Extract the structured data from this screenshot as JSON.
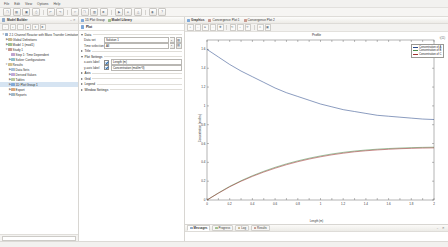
{
  "menu": {
    "items": [
      "File",
      "Edit",
      "View",
      "Options",
      "Help"
    ]
  },
  "toolbar": {
    "buttons": [
      {
        "name": "new-file-button",
        "glyph": "❐"
      },
      {
        "name": "open-file-button",
        "glyph": "▤"
      },
      {
        "name": "save-button",
        "glyph": "▣"
      },
      {
        "name": "print-button",
        "glyph": "⎙"
      },
      {
        "name": "undo-button",
        "glyph": "↶"
      },
      {
        "name": "redo-button",
        "glyph": "↷"
      },
      {
        "name": "cut-button",
        "glyph": "✂"
      },
      {
        "name": "copy-button",
        "glyph": "❐"
      },
      {
        "name": "paste-button",
        "glyph": "▧"
      },
      {
        "name": "delete-button",
        "glyph": "✖"
      },
      {
        "name": "build-button",
        "glyph": "▶"
      },
      {
        "name": "compute-button",
        "glyph": "="
      },
      {
        "name": "mesh-button",
        "glyph": "△"
      },
      {
        "name": "plot-button",
        "glyph": "◉"
      },
      {
        "name": "help-button",
        "glyph": "?"
      }
    ]
  },
  "model_builder": {
    "header": "Model Builder",
    "tools": [
      {
        "name": "collapse-all-icon",
        "glyph": "−"
      },
      {
        "name": "expand-all-icon",
        "glyph": "+"
      },
      {
        "name": "show-hide-icon",
        "glyph": "□"
      },
      {
        "name": "move-up-icon",
        "glyph": "▲"
      },
      {
        "name": "move-down-icon",
        "glyph": "▼"
      },
      {
        "name": "delete-node-icon",
        "glyph": "✖"
      }
    ],
    "tree": [
      {
        "label": "2.1 Channel Reactor with Mass Transfer Limitations",
        "depth": 0,
        "twisty": "▼",
        "color": "#8fa9c8",
        "selected": false
      },
      {
        "label": "Global Definitions",
        "depth": 1,
        "twisty": "▶",
        "color": "#c8b88f",
        "selected": false
      },
      {
        "label": "Model 1 (mod1)",
        "depth": 1,
        "twisty": "▶",
        "color": "#9fbf8f",
        "selected": false
      },
      {
        "label": "Study 1",
        "depth": 1,
        "twisty": "▼",
        "color": "#c89a8f",
        "selected": false
      },
      {
        "label": "Step 1: Time Dependent",
        "depth": 2,
        "twisty": "",
        "color": "#bfa3cf",
        "selected": false
      },
      {
        "label": "Solver Configurations",
        "depth": 2,
        "twisty": "▶",
        "color": "#8fbfc8",
        "selected": false
      },
      {
        "label": "Results",
        "depth": 1,
        "twisty": "▼",
        "color": "#d0c08f",
        "selected": false
      },
      {
        "label": "Data Sets",
        "depth": 2,
        "twisty": "▶",
        "color": "#a8c0d8",
        "selected": false
      },
      {
        "label": "Derived Values",
        "depth": 2,
        "twisty": "▶",
        "color": "#c0a8d8",
        "selected": false
      },
      {
        "label": "Tables",
        "depth": 2,
        "twisty": "▶",
        "color": "#b8c8a0",
        "selected": false
      },
      {
        "label": "1D Plot Group 1",
        "depth": 2,
        "twisty": "▶",
        "color": "#7ea8d8",
        "selected": true
      },
      {
        "label": "Export",
        "depth": 2,
        "twisty": "▶",
        "color": "#d8a87e",
        "selected": false
      },
      {
        "label": "Reports",
        "depth": 2,
        "twisty": "▶",
        "color": "#a0b8c8",
        "selected": false
      }
    ]
  },
  "settings": {
    "tabs": [
      {
        "label": "1D Plot Group",
        "active": false,
        "icon_color": "#7ea8d8"
      },
      {
        "label": "Model Library",
        "active": true,
        "icon_color": "#9fbf8f"
      }
    ],
    "title": "Plot",
    "sections": [
      {
        "name": "data",
        "label": "Data",
        "open": true,
        "fields": [
          {
            "name": "data-set",
            "label": "Data set",
            "value": "Solution 1",
            "type": "combo"
          },
          {
            "name": "time-selection",
            "label": "Time selection",
            "value": "All",
            "type": "combo"
          }
        ]
      },
      {
        "name": "title",
        "label": "Title",
        "open": false,
        "fields": []
      },
      {
        "name": "plot-settings",
        "label": "Plot Settings",
        "open": true,
        "fields": [
          {
            "name": "x-axis-label",
            "label": "x-axis label",
            "value": "Length (m)",
            "type": "check-text",
            "checked": true
          },
          {
            "name": "y-axis-label",
            "label": "y-axis label",
            "value": "Concentration (mol/m^3)",
            "type": "check-text",
            "checked": true
          }
        ]
      },
      {
        "name": "axis",
        "label": "Axis",
        "open": false,
        "fields": []
      },
      {
        "name": "grid",
        "label": "Grid",
        "open": false,
        "fields": []
      },
      {
        "name": "legend",
        "label": "Legend",
        "open": false,
        "fields": []
      },
      {
        "name": "window-settings",
        "label": "Window Settings",
        "open": false,
        "fields": []
      }
    ]
  },
  "graphics": {
    "tabs": [
      {
        "label": "Graphics",
        "active": true,
        "icon_color": "#7ea8d8"
      },
      {
        "label": "Convergence Plot 1",
        "active": false,
        "icon_color": "#c89a8f"
      },
      {
        "label": "Convergence Plot 2",
        "active": false,
        "icon_color": "#c89a8f"
      }
    ],
    "tools": [
      {
        "name": "zoom-in-icon",
        "glyph": "+"
      },
      {
        "name": "zoom-out-icon",
        "glyph": "−"
      },
      {
        "name": "zoom-extents-icon",
        "glyph": "⧉"
      },
      {
        "name": "zoom-box-icon",
        "glyph": "□"
      },
      {
        "name": "pan-icon",
        "glyph": "✚"
      },
      {
        "name": "rotate-icon",
        "glyph": "↻"
      },
      {
        "name": "transparency-icon",
        "glyph": "◐"
      },
      {
        "name": "scene-light-icon",
        "glyph": "☀"
      },
      {
        "name": "print-graphics-icon",
        "glyph": "⎙"
      },
      {
        "name": "image-snapshot-icon",
        "glyph": "▣"
      }
    ],
    "corner_label": "t(11)"
  },
  "chart_data": {
    "type": "line",
    "title": "Profile",
    "xlabel": "Length (m)",
    "ylabel": "Concentration (mol/m³)",
    "xlim": [
      0,
      2.0
    ],
    "ylim": [
      0,
      1.7
    ],
    "xticks": [
      "0",
      "0.1",
      "0.2",
      "0.4",
      "0.6",
      "1",
      "1.2",
      "1.4",
      "1.6",
      "1.8",
      "2",
      "2.2",
      "2.4"
    ],
    "yticks": [
      "0",
      "0.2",
      "0.4",
      "0.6",
      "0.8",
      "1",
      "1.2",
      "1.4",
      "1.6"
    ],
    "grid": false,
    "legend_position": "top-right",
    "series": [
      {
        "name": "Concentration of A",
        "color": "#2a4a8a",
        "x": [
          0,
          0.1,
          0.2,
          0.3,
          0.4,
          0.5,
          0.6,
          0.7,
          0.8,
          0.9,
          1.0,
          1.1,
          1.2,
          1.3,
          1.4,
          1.5,
          1.6,
          1.7,
          1.8,
          1.9,
          2.0
        ],
        "y": [
          1.6,
          1.52,
          1.44,
          1.37,
          1.31,
          1.25,
          1.19,
          1.14,
          1.1,
          1.06,
          1.02,
          0.99,
          0.96,
          0.94,
          0.92,
          0.9,
          0.89,
          0.88,
          0.87,
          0.86,
          0.855
        ]
      },
      {
        "name": "Concentration of B",
        "color": "#4a8a4a",
        "x": [
          0,
          0.1,
          0.2,
          0.3,
          0.4,
          0.5,
          0.6,
          0.7,
          0.8,
          0.9,
          1.0,
          1.1,
          1.2,
          1.3,
          1.4,
          1.5,
          1.6,
          1.7,
          1.8,
          1.9,
          2.0
        ],
        "y": [
          0.0,
          0.075,
          0.145,
          0.205,
          0.258,
          0.305,
          0.347,
          0.384,
          0.416,
          0.444,
          0.468,
          0.489,
          0.506,
          0.52,
          0.531,
          0.54,
          0.547,
          0.552,
          0.556,
          0.559,
          0.561
        ]
      },
      {
        "name": "Concentration of C",
        "color": "#a03030",
        "x": [
          0,
          0.1,
          0.2,
          0.3,
          0.4,
          0.5,
          0.6,
          0.7,
          0.8,
          0.9,
          1.0,
          1.1,
          1.2,
          1.3,
          1.4,
          1.5,
          1.6,
          1.7,
          1.8,
          1.9,
          2.0
        ],
        "y": [
          0.0,
          0.072,
          0.14,
          0.199,
          0.251,
          0.297,
          0.338,
          0.375,
          0.407,
          0.435,
          0.459,
          0.48,
          0.497,
          0.512,
          0.523,
          0.532,
          0.539,
          0.545,
          0.549,
          0.552,
          0.554
        ]
      }
    ]
  },
  "dock": {
    "tabs": [
      {
        "label": "Messages",
        "active": true,
        "icon_color": "#8fa9c8"
      },
      {
        "label": "Progress",
        "active": false,
        "icon_color": "#9fbf8f"
      },
      {
        "label": "Log",
        "active": false,
        "icon_color": "#c8b88f"
      },
      {
        "label": "Results",
        "active": false,
        "icon_color": "#c89a8f"
      }
    ],
    "collapse_glyph": "−",
    "close_glyph": "✕"
  },
  "status": {
    "text": ""
  }
}
